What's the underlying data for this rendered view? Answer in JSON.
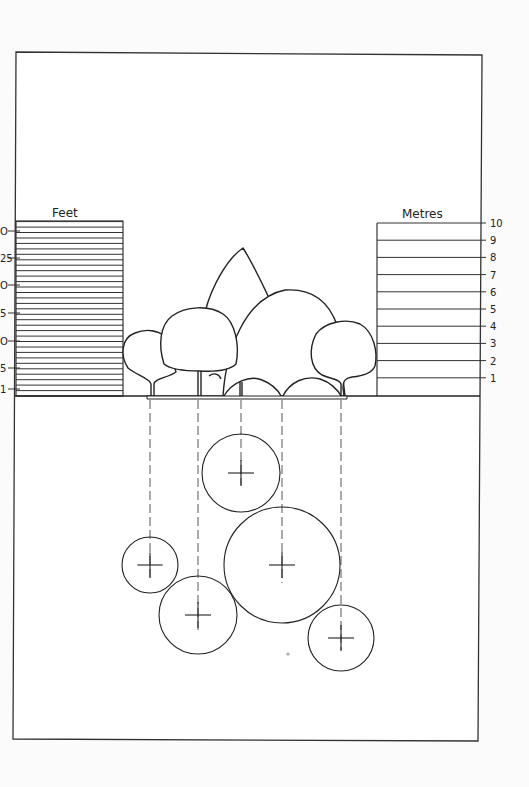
{
  "diagram": {
    "feet_scale": {
      "label": "Feet",
      "ticks": [
        {
          "value": "30",
          "shown": "O"
        },
        {
          "value": "25",
          "shown": "25"
        },
        {
          "value": "20",
          "shown": "O"
        },
        {
          "value": "15",
          "shown": "5"
        },
        {
          "value": "10",
          "shown": "O"
        },
        {
          "value": "5",
          "shown": "5"
        },
        {
          "value": "1",
          "shown": "1"
        }
      ]
    },
    "metres_scale": {
      "label": "Metres",
      "ticks": [
        "10",
        "9",
        "8",
        "7",
        "6",
        "5",
        "4",
        "3",
        "2",
        "1"
      ]
    },
    "elevation": {
      "trees": [
        {
          "id": "tree-1",
          "description": "small rounded tree, far left"
        },
        {
          "id": "tree-2",
          "description": "medium rounded tree, left"
        },
        {
          "id": "tree-3",
          "description": "tall pointed conical tree, back"
        },
        {
          "id": "tree-4",
          "description": "large rounded tree, center"
        },
        {
          "id": "tree-5",
          "description": "medium rounded tree, right"
        }
      ]
    },
    "plan": {
      "circles": [
        {
          "id": "plan-small-left",
          "cx": 150,
          "cy": 565,
          "r": 28
        },
        {
          "id": "plan-medium-left",
          "cx": 198,
          "cy": 615,
          "r": 39
        },
        {
          "id": "plan-top",
          "cx": 241,
          "cy": 473,
          "r": 39
        },
        {
          "id": "plan-large-center",
          "cx": 282,
          "cy": 565,
          "r": 58
        },
        {
          "id": "plan-right",
          "cx": 341,
          "cy": 638,
          "r": 33
        }
      ]
    }
  }
}
